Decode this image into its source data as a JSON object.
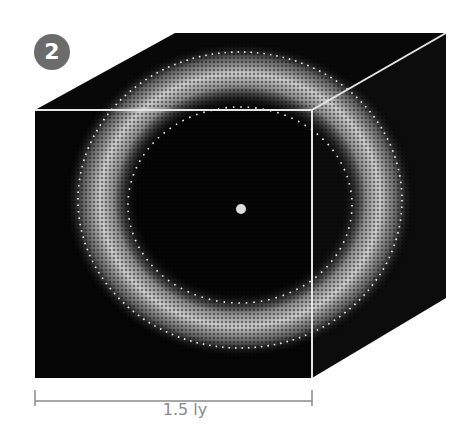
{
  "figure": {
    "badge_number": "2",
    "scale_label": "1.5 ly",
    "center_object": "central-star",
    "structure": "spherical shell of comets around central star inside cube",
    "colors": {
      "cube_fill": "#0a0a0a",
      "cube_edge": "#e6e6e6",
      "shell_glow": "#bdbdbd",
      "star": "#dcdcdc",
      "badge_bg": "#6b6b6b",
      "scale_line": "#8a8a8a"
    }
  }
}
